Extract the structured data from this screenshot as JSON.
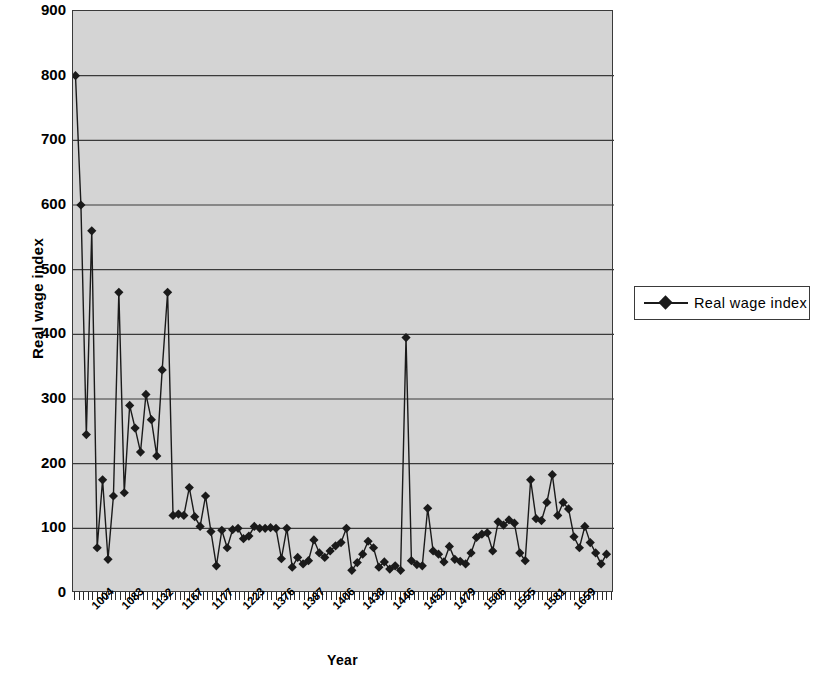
{
  "chart_data": {
    "type": "line",
    "title": "",
    "xlabel": "Year",
    "ylabel": "Real wage index",
    "ylim": [
      0,
      900
    ],
    "ytick_step": 100,
    "yticks": [
      0,
      100,
      200,
      300,
      400,
      500,
      600,
      700,
      800,
      900
    ],
    "grid": true,
    "grid_axis": "y",
    "plot_background": "#d4d4d4",
    "series_color": "#1a1a1a",
    "marker": "diamond",
    "legend": {
      "position": "right",
      "entries": [
        "Real wage index"
      ]
    },
    "xtick_labels": [
      "1004",
      "1083",
      "1132",
      "1167",
      "1177",
      "1223",
      "1376",
      "1387",
      "1406",
      "1438",
      "1446",
      "1453",
      "1479",
      "1506",
      "1555",
      "1581",
      "1659"
    ],
    "xtick_label_rotation": -45,
    "x_minor_ticks": 118,
    "series": [
      {
        "name": "Real wage index",
        "values": [
          800,
          600,
          245,
          560,
          70,
          175,
          52,
          150,
          465,
          155,
          290,
          255,
          218,
          307,
          268,
          212,
          345,
          465,
          120,
          122,
          120,
          163,
          118,
          103,
          150,
          95,
          42,
          97,
          70,
          98,
          100,
          84,
          88,
          103,
          100,
          100,
          101,
          100,
          53,
          100,
          40,
          55,
          45,
          50,
          82,
          62,
          55,
          65,
          73,
          78,
          100,
          35,
          47,
          60,
          80,
          70,
          40,
          48,
          37,
          42,
          35,
          395,
          50,
          44,
          42,
          131,
          65,
          60,
          48,
          72,
          52,
          49,
          45,
          62,
          86,
          91,
          93,
          65,
          110,
          105,
          113,
          108,
          62,
          50,
          175,
          115,
          112,
          140,
          183,
          120,
          140,
          130,
          87,
          70,
          103,
          78,
          62,
          45,
          60
        ]
      }
    ]
  },
  "axes": {
    "y_tick_labels": [
      "900",
      "800",
      "700",
      "600",
      "500",
      "400",
      "300",
      "200",
      "100",
      "0"
    ]
  }
}
